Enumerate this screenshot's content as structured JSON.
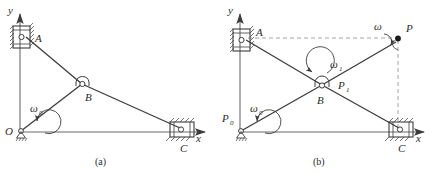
{
  "figure": {
    "caption_a": "(a)",
    "caption_b": "(b)",
    "panel_a": {
      "axis_y": "y",
      "axis_x": "x",
      "origin_label": "O",
      "points": {
        "A": "A",
        "B": "B",
        "C": "C"
      },
      "omega_main": "ω",
      "omega_main_sub": "0"
    },
    "panel_b": {
      "axis_y": "y",
      "axis_x": "x",
      "points": {
        "A": "A",
        "B": "B",
        "C": "C",
        "P": "P"
      },
      "omega_0": "ω",
      "omega_0_sub": "0",
      "omega_1": "ω",
      "omega_1_sub": "1",
      "omega": "ω",
      "P_0": "P",
      "P_0_sub": "0",
      "P_1": "P",
      "P_1_sub": "1"
    }
  },
  "colors": {
    "line": "#3c3c3c",
    "dashed": "#8a8a8a",
    "text": "#2b2b2b",
    "background": "#ffffff"
  }
}
